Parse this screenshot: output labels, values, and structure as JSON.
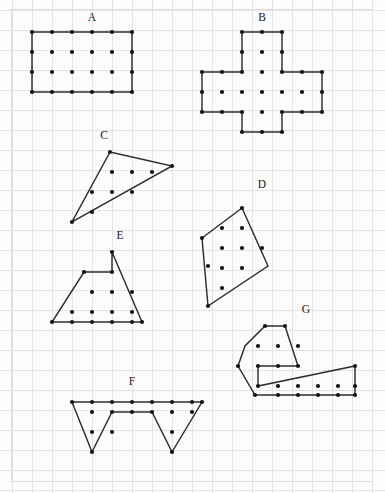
{
  "page": {
    "width": 385,
    "height": 493,
    "background_color": "#fdfdfd",
    "frame_color": "#dcdcdc"
  },
  "grid": {
    "cell_size": 20,
    "origin_x": 12,
    "origin_y": 10,
    "columns": 18,
    "rows": 23,
    "line_color": "#e3e3e3",
    "visible": true
  },
  "style": {
    "outline_color": "#2e2e2e",
    "outline_width": 1.45,
    "dot_color": "#141414",
    "dot_radius": 2.1,
    "label_color": "#1a1a1a",
    "label_size": 11.5
  },
  "chart_data": {
    "type": "scatter",
    "xlabel": "",
    "ylabel": "",
    "grid": true,
    "legend_position": "none",
    "shape_count": 7,
    "labels": [
      "A",
      "B",
      "C",
      "D",
      "E",
      "F",
      "G"
    ]
  },
  "shapes": [
    {
      "id": "shape-a",
      "label": "A",
      "kind": "rectangle",
      "label_pos": [
        92,
        21
      ],
      "vertices": [
        [
          32,
          32
        ],
        [
          132,
          32
        ],
        [
          132,
          92
        ],
        [
          32,
          92
        ]
      ],
      "dots": [
        [
          32,
          32
        ],
        [
          52,
          32
        ],
        [
          72,
          32
        ],
        [
          92,
          32
        ],
        [
          112,
          32
        ],
        [
          132,
          32
        ],
        [
          32,
          52
        ],
        [
          52,
          52
        ],
        [
          72,
          52
        ],
        [
          92,
          52
        ],
        [
          112,
          52
        ],
        [
          132,
          52
        ],
        [
          32,
          72
        ],
        [
          52,
          72
        ],
        [
          72,
          72
        ],
        [
          92,
          72
        ],
        [
          112,
          72
        ],
        [
          132,
          72
        ],
        [
          32,
          92
        ],
        [
          52,
          92
        ],
        [
          72,
          92
        ],
        [
          92,
          92
        ],
        [
          112,
          92
        ],
        [
          132,
          92
        ]
      ]
    },
    {
      "id": "shape-b",
      "label": "B",
      "kind": "cross",
      "label_pos": [
        262,
        21
      ],
      "vertices": [
        [
          242,
          32
        ],
        [
          282,
          32
        ],
        [
          282,
          72
        ],
        [
          322,
          72
        ],
        [
          322,
          112
        ],
        [
          282,
          112
        ],
        [
          282,
          132
        ],
        [
          242,
          132
        ],
        [
          242,
          112
        ],
        [
          202,
          112
        ],
        [
          202,
          72
        ],
        [
          242,
          72
        ]
      ],
      "dots": [
        [
          242,
          32
        ],
        [
          262,
          32
        ],
        [
          282,
          32
        ],
        [
          242,
          52
        ],
        [
          262,
          52
        ],
        [
          282,
          52
        ],
        [
          202,
          72
        ],
        [
          222,
          72
        ],
        [
          242,
          72
        ],
        [
          262,
          72
        ],
        [
          282,
          72
        ],
        [
          302,
          72
        ],
        [
          322,
          72
        ],
        [
          202,
          92
        ],
        [
          222,
          92
        ],
        [
          242,
          92
        ],
        [
          262,
          92
        ],
        [
          282,
          92
        ],
        [
          302,
          92
        ],
        [
          322,
          92
        ],
        [
          202,
          112
        ],
        [
          222,
          112
        ],
        [
          242,
          112
        ],
        [
          262,
          112
        ],
        [
          282,
          112
        ],
        [
          302,
          112
        ],
        [
          322,
          112
        ],
        [
          242,
          132
        ],
        [
          262,
          132
        ],
        [
          282,
          132
        ]
      ]
    },
    {
      "id": "shape-c",
      "label": "C",
      "kind": "triangle",
      "label_pos": [
        104,
        139
      ],
      "vertices": [
        [
          110,
          152
        ],
        [
          172,
          166
        ],
        [
          72,
          222
        ]
      ],
      "dots": [
        [
          110,
          152
        ],
        [
          172,
          166
        ],
        [
          112,
          172
        ],
        [
          132,
          172
        ],
        [
          152,
          172
        ],
        [
          92,
          192
        ],
        [
          112,
          192
        ],
        [
          132,
          192
        ],
        [
          92,
          212
        ],
        [
          72,
          222
        ]
      ]
    },
    {
      "id": "shape-d",
      "label": "D",
      "kind": "quadrilateral",
      "label_pos": [
        262,
        188
      ],
      "vertices": [
        [
          242,
          208
        ],
        [
          268,
          266
        ],
        [
          208,
          306
        ],
        [
          202,
          238
        ]
      ],
      "dots": [
        [
          242,
          208
        ],
        [
          222,
          228
        ],
        [
          242,
          228
        ],
        [
          202,
          238
        ],
        [
          222,
          248
        ],
        [
          242,
          248
        ],
        [
          262,
          248
        ],
        [
          208,
          266
        ],
        [
          222,
          268
        ],
        [
          242,
          268
        ],
        [
          222,
          288
        ],
        [
          208,
          306
        ]
      ]
    },
    {
      "id": "shape-e",
      "label": "E",
      "kind": "concave-polygon",
      "label_pos": [
        120,
        239
      ],
      "vertices": [
        [
          112,
          252
        ],
        [
          142,
          322
        ],
        [
          52,
          322
        ],
        [
          84,
          272
        ],
        [
          112,
          272
        ]
      ],
      "dots": [
        [
          112,
          252
        ],
        [
          84,
          272
        ],
        [
          112,
          272
        ],
        [
          92,
          292
        ],
        [
          112,
          292
        ],
        [
          132,
          292
        ],
        [
          72,
          312
        ],
        [
          92,
          312
        ],
        [
          112,
          312
        ],
        [
          132,
          312
        ],
        [
          52,
          322
        ],
        [
          72,
          322
        ],
        [
          92,
          322
        ],
        [
          112,
          322
        ],
        [
          132,
          322
        ],
        [
          142,
          322
        ]
      ]
    },
    {
      "id": "shape-f",
      "label": "F",
      "kind": "zigzag-polygon",
      "label_pos": [
        132,
        385
      ],
      "vertices": [
        [
          72,
          402
        ],
        [
          202,
          402
        ],
        [
          172,
          452
        ],
        [
          152,
          412
        ],
        [
          112,
          412
        ],
        [
          92,
          452
        ],
        [
          72,
          402
        ]
      ],
      "dots": [
        [
          72,
          402
        ],
        [
          92,
          402
        ],
        [
          112,
          402
        ],
        [
          132,
          402
        ],
        [
          152,
          402
        ],
        [
          172,
          402
        ],
        [
          192,
          402
        ],
        [
          202,
          402
        ],
        [
          92,
          412
        ],
        [
          112,
          412
        ],
        [
          132,
          412
        ],
        [
          152,
          412
        ],
        [
          172,
          412
        ],
        [
          192,
          412
        ],
        [
          92,
          432
        ],
        [
          112,
          432
        ],
        [
          172,
          432
        ],
        [
          92,
          452
        ],
        [
          172,
          452
        ]
      ]
    },
    {
      "id": "shape-g",
      "label": "G",
      "kind": "concave-polygon",
      "label_pos": [
        306,
        313
      ],
      "vertices": [
        [
          265,
          326
        ],
        [
          285,
          326
        ],
        [
          298,
          366
        ],
        [
          258,
          366
        ],
        [
          258,
          386
        ],
        [
          355,
          366
        ],
        [
          355,
          395
        ],
        [
          255,
          395
        ],
        [
          238,
          366
        ],
        [
          245,
          346
        ]
      ],
      "dots": [
        [
          265,
          326
        ],
        [
          285,
          326
        ],
        [
          258,
          346
        ],
        [
          278,
          346
        ],
        [
          298,
          346
        ],
        [
          238,
          366
        ],
        [
          258,
          366
        ],
        [
          278,
          366
        ],
        [
          298,
          366
        ],
        [
          258,
          386
        ],
        [
          278,
          386
        ],
        [
          298,
          386
        ],
        [
          318,
          386
        ],
        [
          338,
          386
        ],
        [
          355,
          386
        ],
        [
          255,
          395
        ],
        [
          278,
          395
        ],
        [
          298,
          395
        ],
        [
          318,
          395
        ],
        [
          338,
          395
        ],
        [
          355,
          395
        ],
        [
          355,
          366
        ]
      ]
    }
  ]
}
